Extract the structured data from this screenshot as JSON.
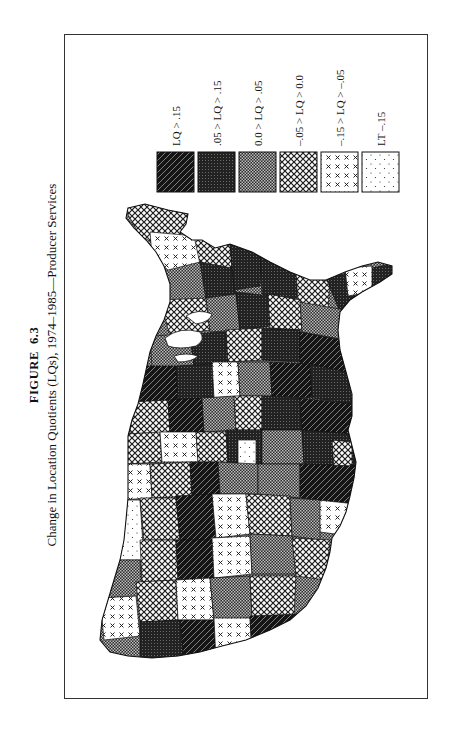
{
  "figure": {
    "label": "FIGURE",
    "number": "6.3",
    "caption": "Change in Location Quotients (LQs), 1974–1985—Producer Services",
    "orientation": "rotated 90° counter-clockwise (landscape figure on portrait page)"
  },
  "map": {
    "subject": "Contiguous United States divided into economic regions, shaded by change in location quotient",
    "pattern_legend": [
      {
        "id": "c1",
        "label": "LQ > .15",
        "pattern": "diagonal-hatch-dark"
      },
      {
        "id": "c2",
        "label": ".05 > LQ > .15",
        "pattern": "dense-dark-stipple"
      },
      {
        "id": "c3",
        "label": "0.0 > LQ > .05",
        "pattern": "fine-checker"
      },
      {
        "id": "c4",
        "label": "–.05 > LQ > 0.0",
        "pattern": "open-crosshatch"
      },
      {
        "id": "c5",
        "label": "–.15 > LQ > –.05",
        "pattern": "sparse-x-marks"
      },
      {
        "id": "c6",
        "label": "LT –.15",
        "pattern": "sparse-dots"
      }
    ]
  },
  "colors": {
    "ink": "#111111",
    "frame": "#333333",
    "paper": "#ffffff"
  }
}
